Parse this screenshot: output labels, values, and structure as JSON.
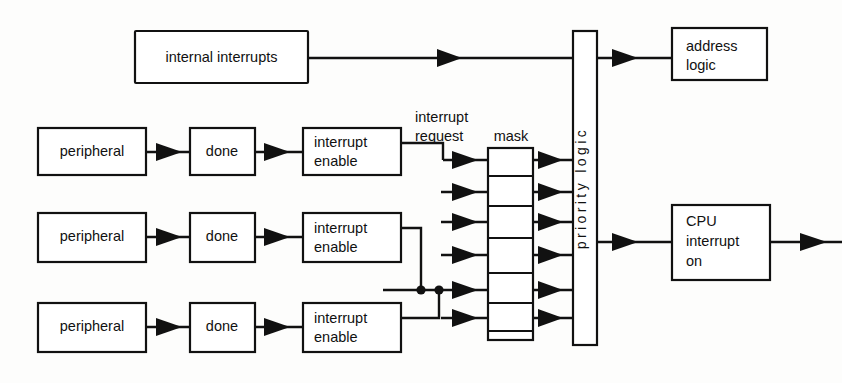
{
  "diagram": {
    "background_color": "#fdfdfc",
    "line_color": "#111111",
    "box_fill": "#ffffff"
  },
  "blocks": {
    "internal_interrupts": {
      "label": "internal interrupts",
      "x": 135,
      "y": 31,
      "w": 173,
      "h": 52
    },
    "address_logic": {
      "line1": "address",
      "line2": "logic",
      "x": 672,
      "y": 28,
      "w": 95,
      "h": 52
    },
    "cpu_interrupt_on": {
      "line1": "CPU",
      "line2": "interrupt",
      "line3": "on",
      "x": 672,
      "y": 205,
      "w": 98,
      "h": 75
    },
    "priority_logic": {
      "label": "priority logic",
      "x": 573,
      "y": 31,
      "w": 24,
      "h": 314
    },
    "mask": {
      "label": "mask",
      "x": 488,
      "y": 148,
      "w": 45,
      "h": 192,
      "cells": 7
    }
  },
  "chains": [
    {
      "row": 1,
      "peripheral": "peripheral",
      "done": "done",
      "interrupt_enable_line1": "interrupt",
      "interrupt_enable_line2": "enable"
    },
    {
      "row": 2,
      "peripheral": "peripheral",
      "done": "done",
      "interrupt_enable_line1": "interrupt",
      "interrupt_enable_line2": "enable"
    },
    {
      "row": 3,
      "peripheral": "peripheral",
      "done": "done",
      "interrupt_enable_line1": "interrupt",
      "interrupt_enable_line2": "enable"
    }
  ],
  "annotations": {
    "interrupt_request_line1": "interrupt",
    "interrupt_request_line2": "request",
    "mask_label": "mask"
  },
  "geometry": {
    "rows_y": [
      152,
      237,
      327
    ],
    "peripheral_x": 38,
    "peripheral_w": 108,
    "done_x": 190,
    "done_w": 65,
    "int_enable_x": 303,
    "int_enable_w": 98,
    "mask_input_arrow_rows": [
      160,
      192,
      222,
      255,
      290,
      318
    ],
    "mask_output_arrow_rows": [
      160,
      192,
      222,
      255,
      290,
      318
    ]
  }
}
